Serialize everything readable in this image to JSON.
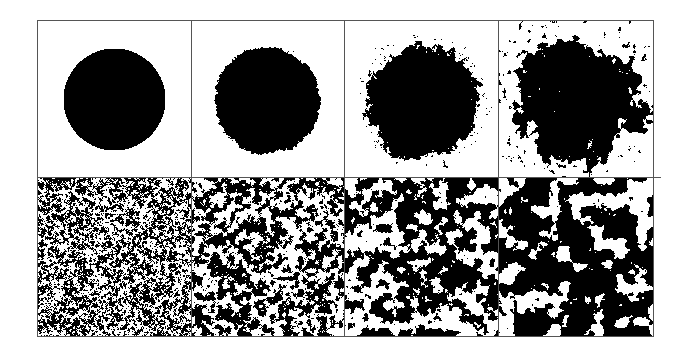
{
  "figure": {
    "colors": {
      "ink": "#000000",
      "paper": "#ffffff",
      "rule": "#555555"
    },
    "grid": {
      "left": 37,
      "top": 20,
      "right": 653,
      "bottom": 336,
      "col_dividers": [
        191,
        344,
        498
      ],
      "row_divider": 177,
      "row_divider_extends_to": 661
    },
    "rows": [
      {
        "name": "cluster-row",
        "panels": [
          {
            "id": "a1",
            "type": "disk",
            "cx": 114,
            "cy": 99,
            "r": 51,
            "roughness": 0.0,
            "scale": 2,
            "seed": 11
          },
          {
            "id": "a2",
            "type": "disk",
            "cx": 267,
            "cy": 100,
            "r": 53,
            "roughness": 0.1,
            "scale": 2,
            "seed": 23
          },
          {
            "id": "a3",
            "type": "disk",
            "cx": 422,
            "cy": 102,
            "r": 56,
            "roughness": 0.28,
            "scale": 3,
            "seed": 37
          },
          {
            "id": "a4",
            "type": "disk",
            "cx": 577,
            "cy": 98,
            "r": 62,
            "roughness": 0.62,
            "scale": 5,
            "seed": 41
          }
        ]
      },
      {
        "name": "noise-row",
        "panels": [
          {
            "id": "b1",
            "type": "noise",
            "scale": 2,
            "threshold": 0.5,
            "seed": 53
          },
          {
            "id": "b2",
            "type": "noise",
            "scale": 4,
            "threshold": 0.5,
            "seed": 67
          },
          {
            "id": "b3",
            "type": "noise",
            "scale": 7,
            "threshold": 0.48,
            "seed": 79
          },
          {
            "id": "b4",
            "type": "noise",
            "scale": 11,
            "threshold": 0.46,
            "seed": 97
          }
        ]
      }
    ]
  }
}
